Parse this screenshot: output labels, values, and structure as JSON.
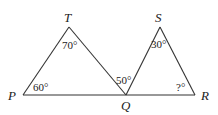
{
  "diagram": {
    "type": "geometry",
    "points": {
      "P": {
        "label": "P",
        "x": 23,
        "y": 95
      },
      "T": {
        "label": "T",
        "x": 69,
        "y": 27
      },
      "Q": {
        "label": "Q",
        "x": 126,
        "y": 95
      },
      "S": {
        "label": "S",
        "x": 160,
        "y": 27
      },
      "R": {
        "label": "R",
        "x": 195,
        "y": 95
      }
    },
    "angles": {
      "P": "60°",
      "T": "70°",
      "TQP": "50°",
      "S": "30°",
      "R": "?°"
    },
    "segments": [
      "PT",
      "TQ",
      "PR",
      "QS",
      "SR"
    ]
  }
}
